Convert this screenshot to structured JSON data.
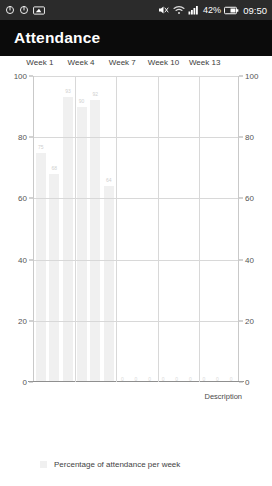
{
  "statusbar": {
    "left_icons": [
      {
        "name": "sync-rotate-icon",
        "glyph": "↻"
      },
      {
        "name": "sync-rotate-icon-2",
        "glyph": "↻"
      },
      {
        "name": "screenshot-icon",
        "glyph": "☐"
      }
    ],
    "volume_muted_icon": "volume-muted-icon",
    "wifi_icon": "wifi-icon",
    "signal_icon": "signal-bars-icon",
    "battery_percent": "42%",
    "battery_icon": "battery-icon",
    "time": "09:50"
  },
  "appbar": {
    "title": "Attendance"
  },
  "legend": {
    "label": "Percentage of attendance per week"
  },
  "chart_data": {
    "type": "bar",
    "title": "Attendance",
    "xlabel": "Description",
    "ylabel": "",
    "ylim": [
      0,
      100
    ],
    "yticks": [
      0,
      20,
      40,
      60,
      80,
      100
    ],
    "ytick_labels_left": [
      "100",
      "80",
      "60",
      "40",
      "20",
      "0"
    ],
    "ytick_labels_right": [
      "100",
      "80",
      "60",
      "40",
      "20",
      "0"
    ],
    "xaxis_position": "top",
    "xtick_labels": [
      "Week 1",
      "Week 4",
      "Week 7",
      "Week 10",
      "Week 13"
    ],
    "xtick_positions": [
      0,
      3,
      6,
      9,
      12
    ],
    "grid": true,
    "legend_position": "bottom-left",
    "series_name": "Percentage of attendance per week",
    "bar_color": "#f0f0f0",
    "categories": [
      "Week 1",
      "Week 2",
      "Week 3",
      "Week 4",
      "Week 5",
      "Week 6",
      "Week 7",
      "Week 8",
      "Week 9",
      "Week 10",
      "Week 11",
      "Week 12",
      "Week 13",
      "Week 14",
      "Week 15"
    ],
    "values": [
      75,
      68,
      93,
      90,
      92,
      64,
      0,
      0,
      0,
      0,
      0,
      0,
      0,
      0,
      0
    ],
    "value_labels": [
      "75",
      "68",
      "93",
      "90",
      "92",
      "64",
      "0",
      "0",
      "0",
      "0",
      "0",
      "0",
      "0",
      "0",
      "0"
    ]
  }
}
